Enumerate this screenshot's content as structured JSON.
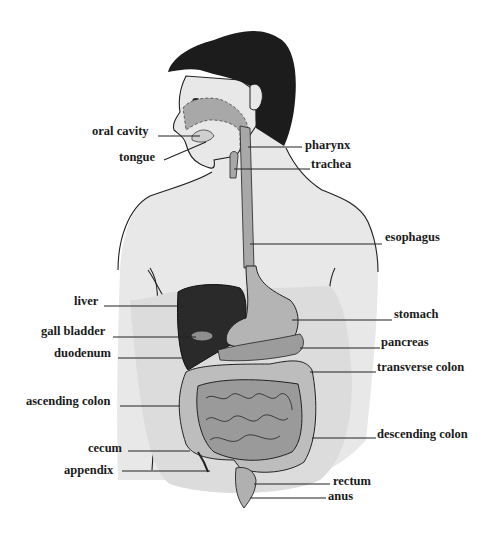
{
  "diagram": {
    "colors": {
      "background": "#ffffff",
      "skin": "#e8e8e8",
      "hair": "#1c1c1c",
      "tract": "#a8a8a8",
      "liver": "#2a2a2a",
      "intestine": "#9a9a9a",
      "outline": "#222222",
      "text": "#1a1a1a"
    },
    "labels_left": [
      {
        "id": "oral-cavity",
        "text": "oral cavity"
      },
      {
        "id": "tongue",
        "text": "tongue"
      },
      {
        "id": "liver",
        "text": "liver"
      },
      {
        "id": "gall-bladder",
        "text": "gall bladder"
      },
      {
        "id": "duodenum",
        "text": "duodenum"
      },
      {
        "id": "ascending-colon",
        "text": "ascending colon"
      },
      {
        "id": "cecum",
        "text": "cecum"
      },
      {
        "id": "appendix",
        "text": "appendix"
      }
    ],
    "labels_right": [
      {
        "id": "pharynx",
        "text": "pharynx"
      },
      {
        "id": "trachea",
        "text": "trachea"
      },
      {
        "id": "esophagus",
        "text": "esophagus"
      },
      {
        "id": "stomach",
        "text": "stomach"
      },
      {
        "id": "pancreas",
        "text": "pancreas"
      },
      {
        "id": "transverse-colon",
        "text": "transverse colon"
      },
      {
        "id": "descending-colon",
        "text": "descending colon"
      },
      {
        "id": "rectum",
        "text": "rectum"
      },
      {
        "id": "anus",
        "text": "anus"
      }
    ]
  }
}
